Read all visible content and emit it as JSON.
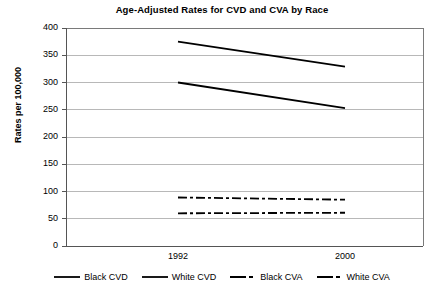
{
  "chart_data": {
    "type": "line",
    "title": "Age-Adjusted Rates for CVD and CVA by Race",
    "xlabel": "",
    "ylabel": "Rates per 100,000",
    "x": [
      "1992",
      "2000"
    ],
    "xticklabels": [
      "1992",
      "2000"
    ],
    "yticklabels": [
      "0",
      "50",
      "100",
      "150",
      "200",
      "250",
      "300",
      "350",
      "400"
    ],
    "yticks": [
      0,
      50,
      100,
      150,
      200,
      250,
      300,
      350,
      400
    ],
    "ylim": [
      0,
      400
    ],
    "grid": "horizontal",
    "legend_position": "bottom",
    "series": [
      {
        "name": "Black CVD",
        "values": [
          375,
          329
        ],
        "style": "solid",
        "color": "#000000"
      },
      {
        "name": "White CVD",
        "values": [
          300,
          253
        ],
        "style": "solid",
        "color": "#000000"
      },
      {
        "name": "Black CVA",
        "values": [
          89,
          85
        ],
        "style": "dash-dot",
        "color": "#000000"
      },
      {
        "name": "White CVA",
        "values": [
          60,
          61
        ],
        "style": "dash-dot",
        "color": "#000000"
      }
    ]
  }
}
